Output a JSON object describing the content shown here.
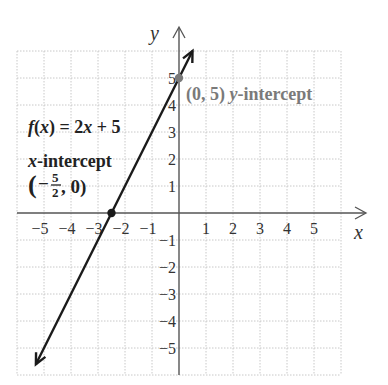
{
  "chart_data": {
    "type": "line",
    "title": "",
    "xlabel": "x",
    "ylabel": "y",
    "xlim": [
      -6,
      6
    ],
    "ylim": [
      -6,
      6
    ],
    "grid": true,
    "x_ticks": [
      -5,
      -4,
      -3,
      -2,
      -1,
      1,
      2,
      3,
      4,
      5
    ],
    "y_ticks": [
      5,
      4,
      3,
      2,
      1,
      -1,
      -2,
      -3,
      -4,
      -5
    ],
    "x_tick_labels": [
      "−5",
      "−4",
      "−3",
      "−2",
      "−1",
      "1",
      "2",
      "3",
      "4",
      "5"
    ],
    "y_tick_labels": [
      "5",
      "4",
      "3",
      "2",
      "1",
      "−1",
      "−2",
      "−3",
      "−4",
      "−5"
    ],
    "series": [
      {
        "name": "f(x) = 2x + 5",
        "equation": "f(x) = 2x + 5",
        "slope": 2,
        "intercept": 5,
        "x": [
          -5.3,
          0.5
        ],
        "y": [
          -5.6,
          6.0
        ],
        "color": "#1a1a1a",
        "arrows": "both"
      }
    ],
    "points": [
      {
        "name": "y-intercept",
        "x": 0,
        "y": 5,
        "color": "#7a7a7a"
      },
      {
        "name": "x-intercept",
        "x": -2.5,
        "y": 0,
        "color": "#1a1a1a"
      }
    ],
    "annotations": {
      "function_label": "f(x) = 2x + 5",
      "y_intercept_label": "(0, 5) y-intercept",
      "x_intercept_title": "x-intercept",
      "x_intercept_coords": "(−5/2, 0)"
    }
  },
  "labels": {
    "x_axis": "x",
    "y_axis": "y",
    "func_f": "f",
    "func_open": "(",
    "func_x": "x",
    "func_rest": ") = 2",
    "func_x2": "x",
    "func_tail": " + 5",
    "yint_coords": "(0, 5) ",
    "yint_y": "y",
    "yint_rest": "-intercept",
    "xint_x": "x",
    "xint_rest": "-intercept",
    "xint_open": "(",
    "xint_minus": "−",
    "xint_num": "5",
    "xint_den": "2",
    "xint_tail": ", 0)"
  },
  "colors": {
    "grid": "#c8c8c8",
    "axis": "#555555",
    "line": "#1a1a1a",
    "y_intercept": "#7a7a7a",
    "text": "#222222"
  }
}
